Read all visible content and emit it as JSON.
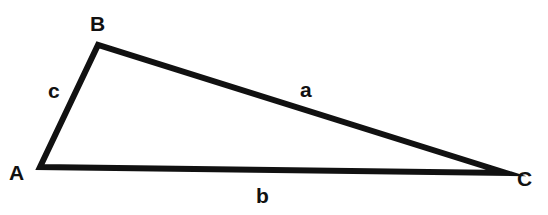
{
  "diagram": {
    "type": "triangle",
    "stroke_color": "#111111",
    "vertices": [
      {
        "label": "A",
        "x": 40,
        "y": 167
      },
      {
        "label": "B",
        "x": 98,
        "y": 45
      },
      {
        "label": "C",
        "x": 506,
        "y": 173
      }
    ],
    "sides": [
      {
        "label": "a",
        "from": "B",
        "to": "C"
      },
      {
        "label": "b",
        "from": "A",
        "to": "C"
      },
      {
        "label": "c",
        "from": "A",
        "to": "B"
      }
    ]
  }
}
